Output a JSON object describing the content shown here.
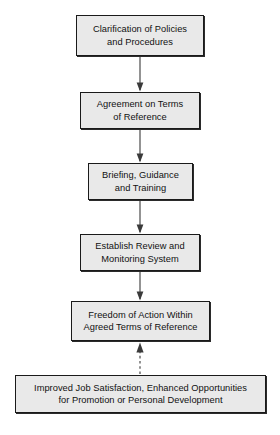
{
  "diagram": {
    "orientation": "vertical-top-down",
    "box_fill_color": "#e9e9e9",
    "box_border_color": "#1a1a1a",
    "connector_color": "#444444",
    "nodes": [
      {
        "id": "node-1",
        "line1": "Clarification of Policies",
        "line2": "and Procedures"
      },
      {
        "id": "node-2",
        "line1": "Agreement on Terms",
        "line2": "of Reference"
      },
      {
        "id": "node-3",
        "line1": "Briefing, Guidance",
        "line2": "and Training"
      },
      {
        "id": "node-4",
        "line1": "Establish Review and",
        "line2": "Monitoring System"
      },
      {
        "id": "node-5",
        "line1": "Freedom of Action Within",
        "line2": "Agreed Terms of Reference"
      },
      {
        "id": "node-6",
        "line1": "Improved Job Satisfaction, Enhanced Opportunities",
        "line2": "for Promotion or Personal Development"
      }
    ],
    "connectors": [
      {
        "id": "arrow-1-2",
        "from": "node-1",
        "to": "node-2",
        "style": "solid",
        "direction": "down"
      },
      {
        "id": "arrow-2-3",
        "from": "node-2",
        "to": "node-3",
        "style": "solid",
        "direction": "down"
      },
      {
        "id": "arrow-3-4",
        "from": "node-3",
        "to": "node-4",
        "style": "solid",
        "direction": "down"
      },
      {
        "id": "arrow-4-5",
        "from": "node-4",
        "to": "node-5",
        "style": "solid",
        "direction": "down"
      },
      {
        "id": "arrow-6-5",
        "from": "node-6",
        "to": "node-5",
        "style": "dashed",
        "direction": "up"
      }
    ]
  }
}
